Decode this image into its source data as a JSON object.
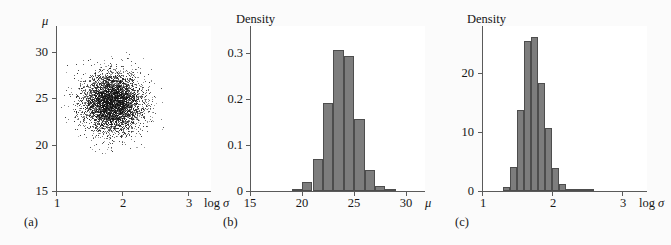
{
  "figure": {
    "background": "#fbfbfb",
    "panel_count": 3,
    "bar_fill": "#7d7d7d",
    "bar_stroke": "#4d4d4d",
    "axis_color": "#5a5a5a",
    "point_color": "#111111"
  },
  "panels": [
    {
      "id": "a",
      "caption": "(a)",
      "ylabel": "μ",
      "xlabel": "log σ"
    },
    {
      "id": "b",
      "caption": "(b)",
      "ylabel": "Density",
      "xlabel": "μ"
    },
    {
      "id": "c",
      "caption": "(c)",
      "ylabel": "Density",
      "xlabel": "log σ"
    }
  ],
  "chart_data": [
    {
      "type": "scatter",
      "panel": "a",
      "title": "",
      "xlabel": "log σ",
      "ylabel": "μ",
      "xlim": [
        1,
        3.35
      ],
      "ylim": [
        15,
        31.5
      ],
      "xticks": [
        1,
        2,
        3
      ],
      "xticklabels": [
        "1",
        "2",
        "3"
      ],
      "yticks": [
        15,
        20,
        25,
        30
      ],
      "yticklabels": [
        "15",
        "20",
        "25",
        "30"
      ],
      "grid": false,
      "legend": "none",
      "n_points": 5000,
      "cloud_center": [
        1.85,
        23.9
      ],
      "cloud_spread_x": 0.23,
      "cloud_spread_y": 1.5,
      "description": "Dense near-circular point cloud of posterior draws centred near log sigma = 1.85, mu = 24, thinning radially outward."
    },
    {
      "type": "bar",
      "panel": "b",
      "title": "",
      "xlabel": "μ",
      "ylabel": "Density",
      "xlim": [
        15,
        31.8
      ],
      "ylim": [
        0,
        0.325
      ],
      "xticks": [
        15,
        20,
        25,
        30
      ],
      "xticklabels": [
        "15",
        "20",
        "25",
        "30"
      ],
      "yticks": [
        0,
        0.1,
        0.2,
        0.3
      ],
      "yticklabels": [
        "0",
        "0.1",
        "0.2",
        "0.3"
      ],
      "grid": false,
      "legend": "none",
      "bin_width": 1,
      "bin_edges": [
        19,
        20,
        21,
        22,
        23,
        24,
        25,
        26,
        27,
        28,
        29
      ],
      "categories": [
        "19-20",
        "20-21",
        "21-22",
        "22-23",
        "23-24",
        "24-25",
        "25-26",
        "26-27",
        "27-28",
        "28-29"
      ],
      "values": [
        0.004,
        0.018,
        0.063,
        0.173,
        0.278,
        0.266,
        0.142,
        0.041,
        0.009,
        0.002
      ],
      "description": "Marginal posterior density histogram of mu, unimodal peaking at 0.278 in the 23-24 bin."
    },
    {
      "type": "bar",
      "panel": "c",
      "title": "",
      "xlabel": "log σ",
      "ylabel": "Density",
      "xlim": [
        1,
        3.35
      ],
      "ylim": [
        0,
        27
      ],
      "xticks": [
        1,
        2,
        3
      ],
      "xticklabels": [
        "1",
        "2",
        "3"
      ],
      "yticks": [
        0,
        10,
        20
      ],
      "yticklabels": [
        "0",
        "10",
        "20"
      ],
      "grid": false,
      "legend": "none",
      "bin_width": 0.1,
      "bin_edges": [
        1.3,
        1.4,
        1.5,
        1.6,
        1.7,
        1.8,
        1.9,
        2.0,
        2.1,
        2.2,
        2.3,
        2.4,
        2.5,
        2.6
      ],
      "categories": [
        "1.3-1.4",
        "1.4-1.5",
        "1.5-1.6",
        "1.6-1.7",
        "1.7-1.8",
        "1.8-1.9",
        "1.9-2.0",
        "2.0-2.1",
        "2.1-2.2",
        "2.2-2.3",
        "2.3-2.4",
        "2.4-2.5",
        "2.5-2.6"
      ],
      "values": [
        0.7,
        3.9,
        13.2,
        24.6,
        25.2,
        17.6,
        10.3,
        3.8,
        1.2,
        0.4,
        0.2,
        0.1,
        0.05
      ],
      "description": "Marginal posterior density histogram of log sigma, unimodal peaking near 25 at 1.8-1.9."
    }
  ]
}
